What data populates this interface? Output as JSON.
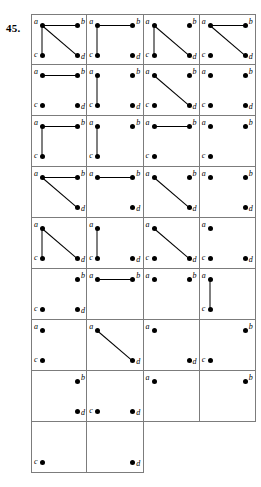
{
  "figure": {
    "exercise_number": "45.",
    "vertex_labels": {
      "a": "a",
      "b": "b",
      "c": "c",
      "d": "d"
    },
    "columns": 4,
    "total_cells": 34,
    "stroke_color": "#000000",
    "grid_line_color": "#7c7c7c",
    "background_color": "#ffffff"
  },
  "chart_data": {
    "type": "diagram",
    "title": "45.",
    "vertex_positions": {
      "a": "top-left",
      "b": "top-right",
      "c": "bottom-left",
      "d": "bottom-right"
    },
    "possible_edges": [
      "ab",
      "ac",
      "ad"
    ],
    "rows": [
      {
        "cells": [
          {
            "vertices": [
              "a",
              "b",
              "c",
              "d"
            ],
            "edges": [
              "ab",
              "ac",
              "ad"
            ]
          },
          {
            "vertices": [
              "a",
              "b",
              "c",
              "d"
            ],
            "edges": [
              "ab",
              "ac"
            ]
          },
          {
            "vertices": [
              "a",
              "b",
              "c",
              "d"
            ],
            "edges": [
              "ac",
              "ad"
            ]
          },
          {
            "vertices": [
              "a",
              "b",
              "c",
              "d"
            ],
            "edges": [
              "ab",
              "ad"
            ]
          }
        ]
      },
      {
        "cells": [
          {
            "vertices": [
              "a",
              "b",
              "c",
              "d"
            ],
            "edges": [
              "ab"
            ]
          },
          {
            "vertices": [
              "a",
              "b",
              "c",
              "d"
            ],
            "edges": [
              "ac"
            ]
          },
          {
            "vertices": [
              "a",
              "b",
              "c",
              "d"
            ],
            "edges": [
              "ad"
            ]
          },
          {
            "vertices": [
              "a",
              "b",
              "c",
              "d"
            ],
            "edges": []
          }
        ]
      },
      {
        "cells": [
          {
            "vertices": [
              "a",
              "b",
              "c"
            ],
            "edges": [
              "ab",
              "ac"
            ]
          },
          {
            "vertices": [
              "a",
              "b",
              "c"
            ],
            "edges": [
              "ac"
            ]
          },
          {
            "vertices": [
              "a",
              "b",
              "c"
            ],
            "edges": [
              "ab"
            ]
          },
          {
            "vertices": [
              "a",
              "b",
              "c"
            ],
            "edges": []
          }
        ]
      },
      {
        "cells": [
          {
            "vertices": [
              "a",
              "b",
              "d"
            ],
            "edges": [
              "ab",
              "ad"
            ]
          },
          {
            "vertices": [
              "a",
              "b",
              "d"
            ],
            "edges": [
              "ab"
            ]
          },
          {
            "vertices": [
              "a",
              "b",
              "d"
            ],
            "edges": [
              "ad"
            ]
          },
          {
            "vertices": [
              "a",
              "b",
              "d"
            ],
            "edges": []
          }
        ]
      },
      {
        "cells": [
          {
            "vertices": [
              "a",
              "c",
              "d"
            ],
            "edges": [
              "ac",
              "ad"
            ]
          },
          {
            "vertices": [
              "a",
              "c",
              "d"
            ],
            "edges": [
              "ac"
            ]
          },
          {
            "vertices": [
              "a",
              "c",
              "d"
            ],
            "edges": [
              "ad"
            ]
          },
          {
            "vertices": [
              "a",
              "c",
              "d"
            ],
            "edges": []
          }
        ]
      },
      {
        "cells": [
          {
            "vertices": [
              "b",
              "c",
              "d"
            ],
            "edges": []
          },
          {
            "vertices": [
              "a",
              "b"
            ],
            "edges": [
              "ab"
            ]
          },
          {
            "vertices": [
              "a",
              "b"
            ],
            "edges": []
          },
          {
            "vertices": [
              "a",
              "c"
            ],
            "edges": [
              "ac"
            ]
          }
        ]
      },
      {
        "cells": [
          {
            "vertices": [
              "a",
              "c"
            ],
            "edges": []
          },
          {
            "vertices": [
              "a",
              "d"
            ],
            "edges": [
              "ad"
            ]
          },
          {
            "vertices": [
              "a",
              "d"
            ],
            "edges": []
          },
          {
            "vertices": [
              "b",
              "c"
            ],
            "edges": []
          }
        ]
      },
      {
        "cells": [
          {
            "vertices": [
              "b",
              "d"
            ],
            "edges": []
          },
          {
            "vertices": [
              "c",
              "d"
            ],
            "edges": []
          },
          {
            "vertices": [
              "a"
            ],
            "edges": []
          },
          {
            "vertices": [
              "b"
            ],
            "edges": []
          }
        ]
      },
      {
        "cells": [
          {
            "vertices": [
              "c"
            ],
            "edges": []
          },
          {
            "vertices": [
              "d"
            ],
            "edges": []
          }
        ]
      }
    ]
  }
}
